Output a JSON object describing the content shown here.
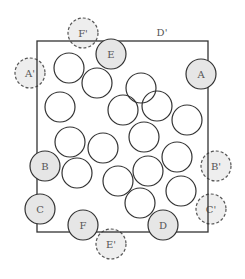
{
  "diagram": {
    "box": {
      "x": 37,
      "y": 41,
      "w": 171,
      "h": 191
    },
    "radius": 15,
    "colors": {
      "stroke": "#333333",
      "fill_shaded": "#e6e6e6",
      "fill_ghost": "#eeeeee",
      "ghost_stroke": "#555555",
      "label": "#555555"
    },
    "label_d_prime": {
      "text": "D'",
      "x": 162,
      "y": 36
    },
    "shaded": [
      {
        "label": "E",
        "cx": 111,
        "cy": 54
      },
      {
        "label": "A",
        "cx": 201,
        "cy": 74
      },
      {
        "label": "B",
        "cx": 45,
        "cy": 166
      },
      {
        "label": "C",
        "cx": 40,
        "cy": 209
      },
      {
        "label": "F",
        "cx": 83,
        "cy": 225
      },
      {
        "label": "D",
        "cx": 163,
        "cy": 225
      }
    ],
    "ghosts": [
      {
        "label": "F'",
        "cx": 83,
        "cy": 33
      },
      {
        "label": "A'",
        "cx": 30,
        "cy": 73
      },
      {
        "label": "B'",
        "cx": 216,
        "cy": 166
      },
      {
        "label": "C'",
        "cx": 211,
        "cy": 209
      },
      {
        "label": "E'",
        "cx": 111,
        "cy": 244
      }
    ],
    "plain": [
      {
        "cx": 69,
        "cy": 68
      },
      {
        "cx": 97,
        "cy": 83
      },
      {
        "cx": 141,
        "cy": 88
      },
      {
        "cx": 60,
        "cy": 107
      },
      {
        "cx": 123,
        "cy": 110
      },
      {
        "cx": 157,
        "cy": 106
      },
      {
        "cx": 187,
        "cy": 120
      },
      {
        "cx": 70,
        "cy": 142
      },
      {
        "cx": 103,
        "cy": 148
      },
      {
        "cx": 144,
        "cy": 137
      },
      {
        "cx": 177,
        "cy": 157
      },
      {
        "cx": 77,
        "cy": 173
      },
      {
        "cx": 118,
        "cy": 181
      },
      {
        "cx": 148,
        "cy": 171
      },
      {
        "cx": 181,
        "cy": 191
      },
      {
        "cx": 140,
        "cy": 203
      }
    ]
  }
}
